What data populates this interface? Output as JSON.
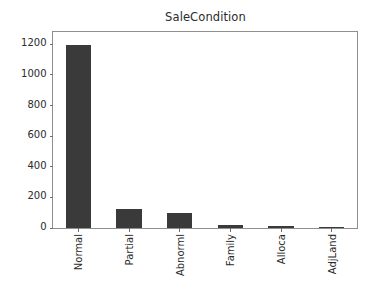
{
  "chart_data": {
    "type": "bar",
    "title": "SaleCondition",
    "xlabel": "",
    "ylabel": "",
    "categories": [
      "Normal",
      "Partial",
      "Abnorml",
      "Family",
      "Alloca",
      "AdjLand"
    ],
    "values": [
      1198,
      125,
      101,
      20,
      12,
      4
    ],
    "ylim": [
      0,
      1280
    ],
    "yticks": [
      0,
      200,
      400,
      600,
      800,
      1000,
      1200
    ],
    "ytick_labels": [
      "0",
      "200",
      "400",
      "600",
      "800",
      "1000",
      "1200"
    ],
    "grid": false,
    "legend": null,
    "bar_color": "#3a3a3a",
    "axes_color": "#8f8f8f",
    "background_color": "#ffffff",
    "xtick_rotation": 90
  }
}
